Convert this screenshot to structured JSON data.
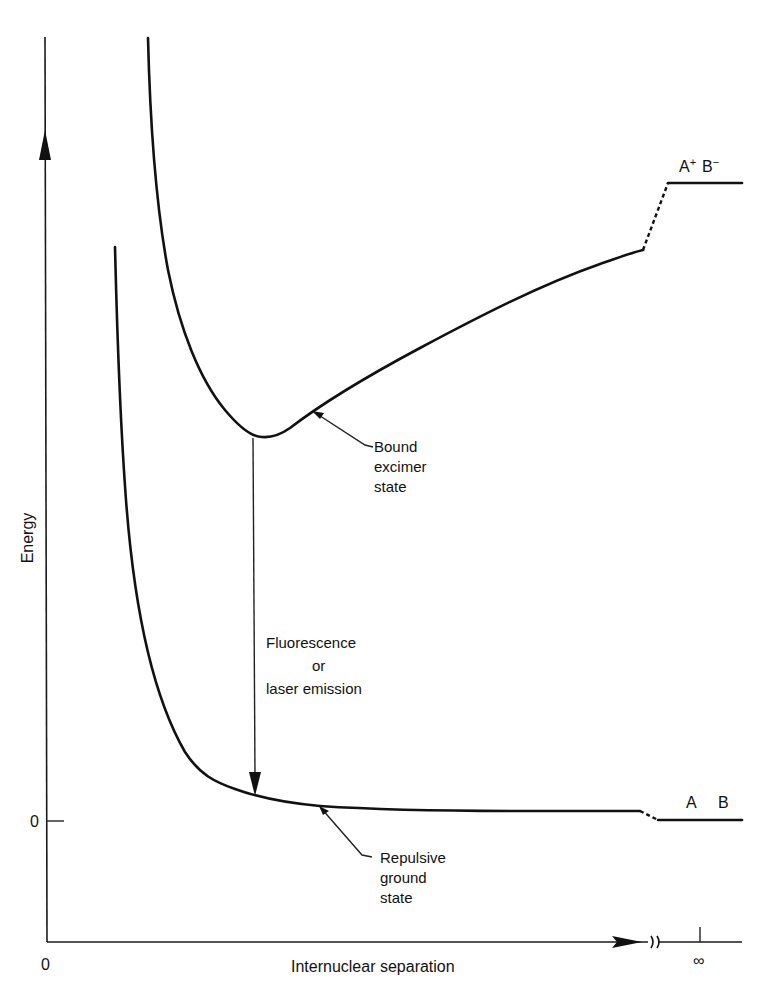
{
  "figure": {
    "type": "potential-energy-diagram",
    "y_axis": {
      "label": "Energy",
      "zero_tick_label": "0"
    },
    "x_axis": {
      "label": "Internuclear separation",
      "origin_label": "0",
      "infinity_label": "∞"
    },
    "curves": {
      "upper": {
        "name": "Bound excimer state",
        "asymptote_label": "A⁺ B⁻",
        "asymptote_plus": "A",
        "asymptote_plus_sup": "+",
        "asymptote_minus": "B",
        "asymptote_minus_sup": "−"
      },
      "lower": {
        "name": "Repulsive ground state",
        "asymptote_label": "A   B",
        "asymptote_a": "A",
        "asymptote_b": "B"
      }
    },
    "annotations": {
      "bound": [
        "Bound",
        "excimer",
        "state"
      ],
      "repulsive": [
        "Repulsive",
        "ground",
        "state"
      ],
      "transition": [
        "Fluorescence",
        "or",
        "laser emission"
      ]
    },
    "colors": {
      "ink": "#111111",
      "background": "#ffffff"
    }
  }
}
